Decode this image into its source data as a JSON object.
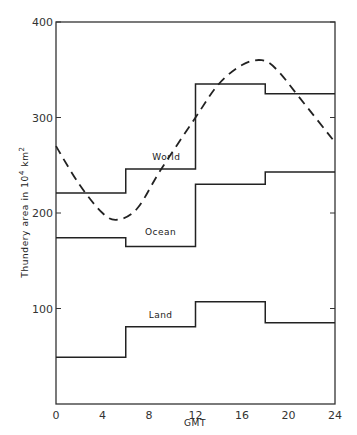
{
  "chart_data": {
    "type": "line",
    "title": "",
    "xlabel": "GMT",
    "ylabel": "Thundery area in 10^4 km^2",
    "ylabel_parts": {
      "main": "Thundery area in 10",
      "sup1": "4",
      "unit": "km",
      "sup2": "2"
    },
    "xlim": [
      0,
      24
    ],
    "ylim": [
      0,
      400
    ],
    "x_ticks": [
      0,
      4,
      8,
      12,
      16,
      20,
      24
    ],
    "y_ticks": [
      100,
      200,
      300,
      400
    ],
    "y_tick_labels": [
      "100",
      "200",
      "300",
      "400"
    ],
    "grid": false,
    "legend": "inline labels",
    "step_bins": [
      [
        0,
        6
      ],
      [
        6,
        12
      ],
      [
        12,
        18
      ],
      [
        18,
        24
      ]
    ],
    "series": [
      {
        "name": "World",
        "style": "step",
        "values": [
          221,
          246,
          335,
          325
        ],
        "label_pos": {
          "x": 9.5,
          "y": 255
        }
      },
      {
        "name": "Ocean",
        "style": "step",
        "values": [
          174,
          165,
          230,
          243
        ],
        "label_pos": {
          "x": 9,
          "y": 177
        }
      },
      {
        "name": "Land",
        "style": "step",
        "values": [
          49,
          81,
          107,
          85
        ],
        "label_pos": {
          "x": 9,
          "y": 90
        }
      },
      {
        "name": "World (smoothed)",
        "style": "dashed-curve",
        "x": [
          0,
          2,
          4,
          5.3,
          7,
          9,
          12,
          14,
          16,
          17.7,
          19,
          21,
          24
        ],
        "values": [
          270,
          230,
          200,
          193,
          205,
          245,
          300,
          335,
          355,
          360,
          350,
          320,
          274
        ]
      }
    ]
  }
}
